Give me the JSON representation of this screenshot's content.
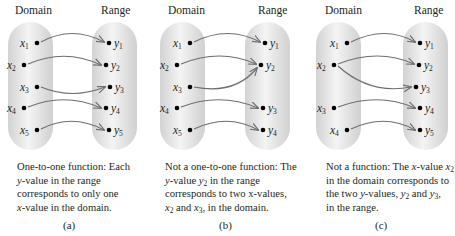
{
  "headers": {
    "domain": "Domain",
    "range": "Range"
  },
  "colors": {
    "oval_edge": "#d4d4d4",
    "oval_center": "#f7f7f7",
    "arrow": "#6d6e71",
    "dot": "#000000",
    "text": "#231f20"
  },
  "panels": [
    {
      "id": "a",
      "label": "(a)",
      "caption": {
        "line1": "One-to-one function: Each",
        "line2_pre": "",
        "line2_var": "y",
        "line2_post": "-value in the range",
        "line3": "corresponds to only one",
        "line4_var": "x",
        "line4_post": "-value in the domain."
      },
      "domain_points": [
        "x1",
        "x2",
        "x3",
        "x4",
        "x5"
      ],
      "range_points": [
        "y1",
        "y2",
        "y3",
        "y4",
        "y5"
      ],
      "mappings": [
        [
          "x1",
          "y1"
        ],
        [
          "x2",
          "y2"
        ],
        [
          "x3",
          "y3"
        ],
        [
          "x4",
          "y4"
        ],
        [
          "x5",
          "y5"
        ]
      ]
    },
    {
      "id": "b",
      "label": "(b)",
      "caption": {
        "line1": "Not a one-to-one function: The",
        "line2_var": "y",
        "line2_mid": "-value ",
        "line2_var2": "y",
        "line2_sub": "2",
        "line2_post": " in the range",
        "line3": "corresponds to two x-values,",
        "line4_a": "x",
        "line4_a_sub": "2",
        "line4_mid": " and ",
        "line4_b": "x",
        "line4_b_sub": "3",
        "line4_post": ", in the domain."
      },
      "domain_points": [
        "x1",
        "x2",
        "x3",
        "x4",
        "x5"
      ],
      "range_points": [
        "y1",
        "y2",
        "y3",
        "y4"
      ],
      "mappings": [
        [
          "x1",
          "y1"
        ],
        [
          "x2",
          "y2"
        ],
        [
          "x3",
          "y2"
        ],
        [
          "x4",
          "y3"
        ],
        [
          "x5",
          "y4"
        ]
      ]
    },
    {
      "id": "c",
      "label": "(c)",
      "caption": {
        "line1_pre": "Not a function: The ",
        "line1_var": "x",
        "line1_mid": "-value ",
        "line1_var2": "x",
        "line1_sub": "2",
        "line2": "in the domain corresponds to",
        "line3_pre": "the two ",
        "line3_var": "y",
        "line3_mid": "-values, ",
        "line3_a": "y",
        "line3_a_sub": "2",
        "line3_and": " and ",
        "line3_b": "y",
        "line3_b_sub": "3",
        "line3_post": ",",
        "line4": "in the range."
      },
      "domain_points": [
        "x1",
        "x2",
        "x3",
        "x4"
      ],
      "range_points": [
        "y1",
        "y2",
        "y3",
        "y4",
        "y5"
      ],
      "mappings": [
        [
          "x1",
          "y1"
        ],
        [
          "x2",
          "y2"
        ],
        [
          "x2",
          "y3"
        ],
        [
          "x3",
          "y4"
        ],
        [
          "x4",
          "y5"
        ]
      ]
    }
  ],
  "point_labels": {
    "x": "x",
    "y": "y",
    "subs": [
      "1",
      "2",
      "3",
      "4",
      "5"
    ]
  }
}
